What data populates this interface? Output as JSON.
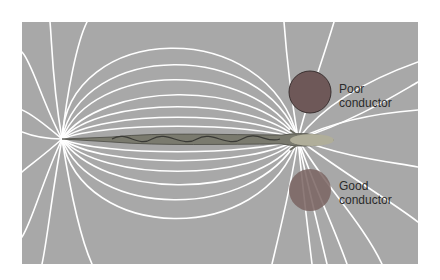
{
  "diagram": {
    "background_color": "#a8a8a8",
    "field_line_color": "#ffffff",
    "objects": [
      {
        "id": "poor",
        "label_line1": "Poor",
        "label_line2": "conductor",
        "color": "#6e5858"
      },
      {
        "id": "good",
        "label_line1": "Good",
        "label_line2": "conductor",
        "color": "#7a6462"
      }
    ]
  }
}
